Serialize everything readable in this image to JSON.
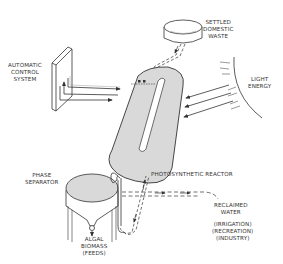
{
  "diagram": {
    "colors": {
      "line": "#333333",
      "fill": "#d9d9d9",
      "background": "#ffffff"
    },
    "nodes": {
      "settled_waste": {
        "lines": [
          "SETTLED",
          "DOMESTIC",
          "WASTE"
        ]
      },
      "control_system": {
        "lines": [
          "AUTOMATIC",
          "CONTROL",
          "SYSTEM"
        ]
      },
      "light_energy": {
        "lines": [
          "LIGHT",
          "ENERGY"
        ]
      },
      "reactor": {
        "label": "PHOTOSYNTHETIC REACTOR"
      },
      "phase_separator": {
        "lines": [
          "PHASE",
          "SEPARATOR"
        ]
      },
      "algal_biomass": {
        "lines": [
          "ALGAL",
          "BIOMASS",
          "(FEEDS)"
        ]
      },
      "reclaimed_water": {
        "lines": [
          "RECLAIMED",
          "WATER"
        ]
      },
      "water_uses": {
        "lines": [
          "(IRRIGATION)",
          "(RECREATION)",
          "(INDUSTRY)"
        ]
      }
    },
    "edges": [
      {
        "from": "settled_waste",
        "to": "reactor",
        "style": "dashed"
      },
      {
        "from": "control_system",
        "to": "reactor",
        "style": "solid",
        "count": 3
      },
      {
        "from": "light_energy",
        "to": "reactor",
        "style": "solid",
        "count": 3
      },
      {
        "from": "reactor",
        "to": "phase_separator",
        "style": "pipe"
      },
      {
        "from": "phase_separator",
        "to": "reactor",
        "style": "dashed"
      },
      {
        "from": "phase_separator",
        "to": "reclaimed_water",
        "style": "dashed"
      },
      {
        "from": "phase_separator",
        "to": "algal_biomass",
        "style": "solid"
      }
    ]
  }
}
